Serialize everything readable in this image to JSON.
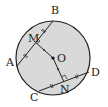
{
  "diagram": {
    "type": "circle-chords",
    "colors": {
      "fill": "#d9d9d9",
      "stroke": "#222222",
      "background": "#ffffff"
    },
    "circle": {
      "center_label": "O",
      "cx": 53,
      "cy": 58,
      "r": 37
    },
    "points": {
      "A": {
        "label": "A",
        "x": 17,
        "y": 66
      },
      "B": {
        "label": "B",
        "x": 53,
        "y": 21
      },
      "C": {
        "label": "C",
        "x": 39,
        "y": 91
      },
      "D": {
        "label": "D",
        "x": 89,
        "y": 72
      },
      "M": {
        "label": "M",
        "x": 34,
        "y": 41
      },
      "N": {
        "label": "N",
        "x": 64,
        "y": 82
      },
      "O": {
        "label": "O",
        "x": 53,
        "y": 58
      }
    },
    "segments": [
      "AB",
      "CD",
      "OM",
      "ON"
    ],
    "annotations": [
      "OM ⊥ AB",
      "ON ⊥ CD",
      "AM = MB",
      "CN = ND"
    ]
  }
}
